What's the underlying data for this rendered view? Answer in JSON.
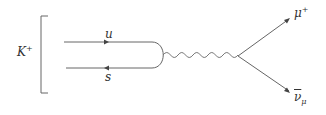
{
  "diagram": {
    "type": "feynman",
    "initial_state": {
      "label": "K",
      "superscript": "+"
    },
    "quarks": [
      {
        "label": "u",
        "direction": "right"
      },
      {
        "label": "s",
        "direction": "left"
      }
    ],
    "propagator": {
      "type": "wavy"
    },
    "outgoing": [
      {
        "label": "μ",
        "superscript": "+"
      },
      {
        "label": "ν",
        "overline": true,
        "subscript": "μ"
      }
    ],
    "colors": {
      "line": "#555555",
      "text": "#333333"
    }
  }
}
